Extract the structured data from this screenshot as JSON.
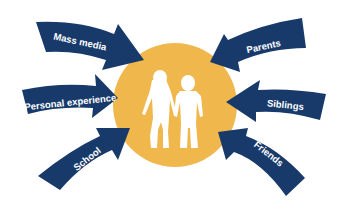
{
  "diagram": {
    "type": "influence-hub",
    "center": {
      "label": "Children (girl and boy holding hands)",
      "icon": "children-silhouette-icon",
      "circle_color": "#F0B84C",
      "figure_color": "#FFFFFF"
    },
    "arrow_color": "#173A6B",
    "arrows": [
      {
        "label": "Mass media",
        "side": "left",
        "position": "top"
      },
      {
        "label": "Personal experience",
        "side": "left",
        "position": "middle"
      },
      {
        "label": "School",
        "side": "left",
        "position": "bottom"
      },
      {
        "label": "Parents",
        "side": "right",
        "position": "top"
      },
      {
        "label": "Siblings",
        "side": "right",
        "position": "middle"
      },
      {
        "label": "Friends",
        "side": "right",
        "position": "bottom"
      }
    ]
  }
}
